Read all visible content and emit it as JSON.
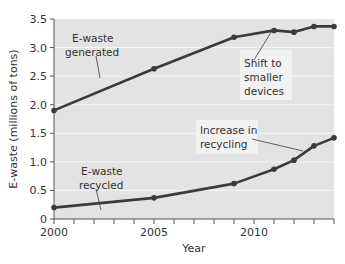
{
  "chart_data": {
    "type": "line",
    "title": "",
    "xlabel": "Year",
    "ylabel": "E-waste (millions of tons)",
    "xlim": [
      2000,
      2014
    ],
    "ylim": [
      0,
      3.5
    ],
    "x_tick_labels": [
      "2000",
      "2005",
      "2010"
    ],
    "x_minor_ticks": [
      2000,
      2001,
      2002,
      2003,
      2004,
      2005,
      2006,
      2007,
      2008,
      2009,
      2010,
      2011,
      2012,
      2013,
      2014
    ],
    "y_tick_labels": [
      "0",
      "0.5",
      "1.0",
      "1.5",
      "2.0",
      "2.5",
      "3.0",
      "3.5"
    ],
    "grid": "horizontal white lines",
    "series": [
      {
        "name": "E-waste generated",
        "x": [
          2000,
          2005,
          2009,
          2011,
          2012,
          2013,
          2014
        ],
        "values": [
          1.9,
          2.63,
          3.18,
          3.3,
          3.27,
          3.37,
          3.37
        ]
      },
      {
        "name": "E-waste recycled",
        "x": [
          2000,
          2005,
          2009,
          2011,
          2012,
          2013,
          2014
        ],
        "values": [
          0.2,
          0.37,
          0.62,
          0.87,
          1.03,
          1.28,
          1.42
        ]
      }
    ],
    "annotations": [
      {
        "text": "E-waste generated",
        "lines": [
          "E-waste",
          "generated"
        ]
      },
      {
        "text": "E-waste recycled",
        "lines": [
          "E-waste",
          "recycled"
        ]
      },
      {
        "text": "Shift to smaller devices",
        "lines": [
          "Shift to",
          "smaller",
          "devices"
        ]
      },
      {
        "text": "Increase in recycling",
        "lines": [
          "Increase in",
          "recycling"
        ]
      }
    ],
    "colors": {
      "plot_background": "#e3e3e3",
      "line": "#3a3a3a",
      "grid": "#f5f5f5",
      "annotation_box": "#f2f2f2"
    }
  }
}
